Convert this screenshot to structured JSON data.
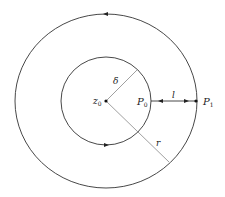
{
  "diagram": {
    "center": {
      "x": 106,
      "y": 101
    },
    "outer_circle": {
      "rx": 91,
      "ry": 87,
      "orientation": "counterclockwise"
    },
    "inner_circle": {
      "rx": 45,
      "ry": 44,
      "orientation": "counterclockwise"
    },
    "labels": {
      "z0": "z",
      "z0_sub": "0",
      "delta": "δ",
      "P0": "P",
      "P0_sub": "0",
      "P1": "P",
      "P1_sub": "1",
      "l": "l",
      "r": "r"
    },
    "colors": {
      "circle": "#333333",
      "radius_line": "#888888",
      "background": "#ffffff"
    }
  }
}
